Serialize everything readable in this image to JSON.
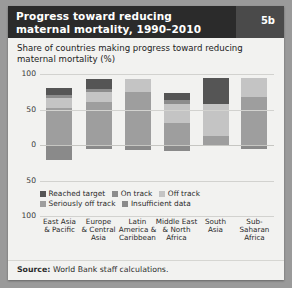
{
  "header": {
    "title_line1": "Progress toward reducing",
    "title_line2": "maternal mortality, 1990–2010",
    "badge": "5b",
    "bg_color": "#2b2b2b",
    "badge_panel_color": "#4a4a4a"
  },
  "subtitle": "Share of countries making progress toward reducing maternal mortality (%)",
  "source": {
    "label": "Source:",
    "text": "World Bank staff calculations."
  },
  "chart_data": {
    "type": "bar",
    "title": "Share of countries making progress toward reducing maternal mortality (%)",
    "xlabel": "",
    "ylabel": "%",
    "stacked": true,
    "diverging": true,
    "grid": true,
    "legend_position": "bottom-left",
    "ylim": [
      -100,
      100
    ],
    "yticks": [
      100,
      50,
      0,
      50,
      100
    ],
    "ytick_labels": [
      "100",
      "50",
      "0",
      "50",
      "100"
    ],
    "categories": [
      "East Asia & Pacific",
      "Europe & Central Asia",
      "Latin America & Caribbean",
      "Middle East & North Africa",
      "South Asia",
      "Sub-Saharan Africa"
    ],
    "category_lines": [
      [
        "East Asia",
        "& Pacific"
      ],
      [
        "Europe",
        "& Central",
        "Asia"
      ],
      [
        "Latin",
        "America &",
        "Caribbean"
      ],
      [
        "Middle East",
        "& North",
        "Africa"
      ],
      [
        "South",
        "Asia"
      ],
      [
        "Sub-Saharan",
        "Africa"
      ]
    ],
    "series": [
      {
        "name": "Reached target",
        "color": "#555555",
        "values": [
          9,
          14,
          0,
          10,
          37,
          0
        ]
      },
      {
        "name": "On track",
        "color": "#8c8c8c",
        "values": [
          5,
          5,
          0,
          5,
          0,
          0
        ]
      },
      {
        "name": "Off track",
        "color": "#c4c4c4",
        "values": [
          14,
          14,
          18,
          27,
          45,
          27
        ]
      },
      {
        "name": "Seriously off track",
        "color": "#9e9e9e",
        "values": [
          52,
          60,
          75,
          31,
          13,
          68
        ]
      },
      {
        "name": "Insufficient data",
        "color": "#8a8a8a",
        "values": [
          -21,
          -5,
          -7,
          -8,
          -2,
          -5
        ]
      }
    ]
  },
  "legend": [
    {
      "label": "Reached target",
      "color": "#555555"
    },
    {
      "label": "On track",
      "color": "#8c8c8c"
    },
    {
      "label": "Off track",
      "color": "#c4c4c4"
    },
    {
      "label": "Seriously off track",
      "color": "#9e9e9e"
    },
    {
      "label": "Insufficient data",
      "color": "#8a8a8a"
    }
  ]
}
